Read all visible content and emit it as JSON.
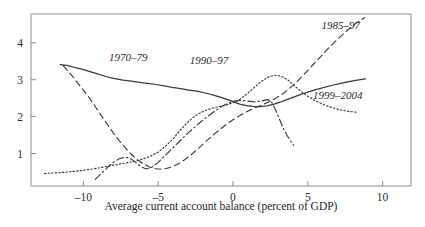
{
  "figure": {
    "clipped_top_text": "",
    "background": "#ffffff",
    "ink_color": "#3a3a3a",
    "axis_color": "#8d8d8d"
  },
  "chart_data": {
    "type": "line",
    "title": "",
    "xlabel": "Average current account balance (percent of GDP)",
    "ylabel": "",
    "xlim": [
      -13.5,
      11.9
    ],
    "ylim": [
      0.12,
      4.78
    ],
    "xticks": [
      -10,
      -5,
      0,
      5,
      10
    ],
    "xtick_labels": [
      "–10",
      "–5",
      "0",
      "5",
      "10"
    ],
    "yticks": [
      1,
      2,
      3,
      4
    ],
    "ytick_labels": [
      "1",
      "2",
      "3",
      "4"
    ],
    "grid": false,
    "legend_position": "inline-annotations",
    "series": [
      {
        "name": "1970–79",
        "style": "solid",
        "label_x": -7.0,
        "label_y": 3.52,
        "points": [
          [
            -11.55,
            3.41
          ],
          [
            -11.1,
            3.39
          ],
          [
            -10.55,
            3.33
          ],
          [
            -10.05,
            3.28
          ],
          [
            -9.55,
            3.22
          ],
          [
            -9.0,
            3.15
          ],
          [
            -8.45,
            3.08
          ],
          [
            -7.9,
            3.03
          ],
          [
            -7.35,
            2.99
          ],
          [
            -6.8,
            2.96
          ],
          [
            -6.25,
            2.93
          ],
          [
            -5.7,
            2.9
          ],
          [
            -5.15,
            2.87
          ],
          [
            -4.6,
            2.83
          ],
          [
            -4.05,
            2.79
          ],
          [
            -3.5,
            2.76
          ],
          [
            -2.95,
            2.72
          ],
          [
            -2.4,
            2.69
          ],
          [
            -1.85,
            2.64
          ],
          [
            -1.3,
            2.58
          ],
          [
            -0.8,
            2.52
          ],
          [
            -0.35,
            2.46
          ],
          [
            0.05,
            2.4
          ],
          [
            0.45,
            2.34
          ],
          [
            0.9,
            2.3
          ],
          [
            1.35,
            2.28
          ],
          [
            1.8,
            2.27
          ],
          [
            2.25,
            2.29
          ],
          [
            2.7,
            2.33
          ],
          [
            3.15,
            2.39
          ],
          [
            3.6,
            2.46
          ],
          [
            4.05,
            2.53
          ],
          [
            4.55,
            2.6
          ],
          [
            5.05,
            2.67
          ],
          [
            5.55,
            2.73
          ],
          [
            6.1,
            2.79
          ],
          [
            6.65,
            2.85
          ],
          [
            7.2,
            2.9
          ],
          [
            7.75,
            2.95
          ],
          [
            8.3,
            2.99
          ],
          [
            8.85,
            3.02
          ]
        ]
      },
      {
        "name": "1985–97",
        "style": "dashed",
        "label_x": 7.2,
        "label_y": 4.38,
        "points": [
          [
            -11.35,
            3.38
          ],
          [
            -10.9,
            3.18
          ],
          [
            -10.45,
            2.95
          ],
          [
            -10.0,
            2.72
          ],
          [
            -9.55,
            2.48
          ],
          [
            -9.15,
            2.24
          ],
          [
            -8.75,
            2.0
          ],
          [
            -8.35,
            1.76
          ],
          [
            -7.95,
            1.53
          ],
          [
            -7.55,
            1.32
          ],
          [
            -7.15,
            1.13
          ],
          [
            -6.75,
            0.96
          ],
          [
            -6.35,
            0.82
          ],
          [
            -5.95,
            0.71
          ],
          [
            -5.55,
            0.63
          ],
          [
            -5.1,
            0.58
          ],
          [
            -4.65,
            0.58
          ],
          [
            -4.2,
            0.62
          ],
          [
            -3.7,
            0.71
          ],
          [
            -3.2,
            0.84
          ],
          [
            -2.7,
            1.0
          ],
          [
            -2.2,
            1.18
          ],
          [
            -1.7,
            1.37
          ],
          [
            -1.15,
            1.56
          ],
          [
            -0.6,
            1.74
          ],
          [
            -0.05,
            1.9
          ],
          [
            0.5,
            2.04
          ],
          [
            1.05,
            2.16
          ],
          [
            1.6,
            2.26
          ],
          [
            2.2,
            2.36
          ],
          [
            2.8,
            2.48
          ],
          [
            3.4,
            2.64
          ],
          [
            4.0,
            2.84
          ],
          [
            4.6,
            3.08
          ],
          [
            5.2,
            3.34
          ],
          [
            5.8,
            3.6
          ],
          [
            6.4,
            3.86
          ],
          [
            7.0,
            4.1
          ],
          [
            7.6,
            4.32
          ],
          [
            8.2,
            4.52
          ],
          [
            8.8,
            4.68
          ]
        ]
      },
      {
        "name": "1990–97",
        "style": "dashdot",
        "label_x": -1.6,
        "label_y": 3.42,
        "points": [
          [
            -9.2,
            0.3
          ],
          [
            -8.8,
            0.46
          ],
          [
            -8.4,
            0.62
          ],
          [
            -8.0,
            0.76
          ],
          [
            -7.6,
            0.86
          ],
          [
            -7.2,
            0.9
          ],
          [
            -6.85,
            0.86
          ],
          [
            -6.5,
            0.76
          ],
          [
            -6.15,
            0.64
          ],
          [
            -5.8,
            0.58
          ],
          [
            -5.45,
            0.62
          ],
          [
            -5.05,
            0.74
          ],
          [
            -4.65,
            0.9
          ],
          [
            -4.25,
            1.06
          ],
          [
            -3.85,
            1.22
          ],
          [
            -3.45,
            1.38
          ],
          [
            -3.05,
            1.54
          ],
          [
            -2.6,
            1.7
          ],
          [
            -2.15,
            1.86
          ],
          [
            -1.7,
            2.0
          ],
          [
            -1.25,
            2.14
          ],
          [
            -0.8,
            2.26
          ],
          [
            -0.35,
            2.36
          ],
          [
            0.1,
            2.42
          ],
          [
            0.55,
            2.44
          ],
          [
            1.0,
            2.42
          ],
          [
            1.45,
            2.4
          ],
          [
            1.9,
            2.42
          ],
          [
            2.35,
            2.46
          ],
          [
            2.6,
            2.38
          ],
          [
            2.85,
            2.18
          ],
          [
            3.1,
            1.94
          ],
          [
            3.35,
            1.7
          ],
          [
            3.6,
            1.5
          ],
          [
            3.85,
            1.34
          ],
          [
            4.05,
            1.22
          ]
        ]
      },
      {
        "name": "1999–2004",
        "style": "dotted",
        "label_x": 7.0,
        "label_y": 2.48,
        "points": [
          [
            -12.6,
            0.46
          ],
          [
            -12.1,
            0.47
          ],
          [
            -11.6,
            0.48
          ],
          [
            -11.05,
            0.5
          ],
          [
            -10.5,
            0.52
          ],
          [
            -9.95,
            0.55
          ],
          [
            -9.4,
            0.58
          ],
          [
            -8.85,
            0.62
          ],
          [
            -8.3,
            0.66
          ],
          [
            -7.75,
            0.7
          ],
          [
            -7.2,
            0.74
          ],
          [
            -6.65,
            0.78
          ],
          [
            -6.1,
            0.84
          ],
          [
            -5.55,
            0.92
          ],
          [
            -5.0,
            1.04
          ],
          [
            -4.5,
            1.2
          ],
          [
            -4.0,
            1.4
          ],
          [
            -3.55,
            1.62
          ],
          [
            -3.1,
            1.82
          ],
          [
            -2.65,
            1.98
          ],
          [
            -2.2,
            2.1
          ],
          [
            -1.75,
            2.18
          ],
          [
            -1.3,
            2.24
          ],
          [
            -0.85,
            2.28
          ],
          [
            -0.4,
            2.32
          ],
          [
            0.05,
            2.38
          ],
          [
            0.5,
            2.48
          ],
          [
            0.95,
            2.62
          ],
          [
            1.4,
            2.78
          ],
          [
            1.85,
            2.94
          ],
          [
            2.3,
            3.06
          ],
          [
            2.75,
            3.12
          ],
          [
            3.2,
            3.1
          ],
          [
            3.65,
            3.0
          ],
          [
            4.1,
            2.84
          ],
          [
            4.55,
            2.68
          ],
          [
            5.05,
            2.54
          ],
          [
            5.55,
            2.42
          ],
          [
            6.1,
            2.32
          ],
          [
            6.65,
            2.24
          ],
          [
            7.2,
            2.18
          ],
          [
            7.75,
            2.14
          ],
          [
            8.3,
            2.12
          ]
        ]
      }
    ]
  }
}
